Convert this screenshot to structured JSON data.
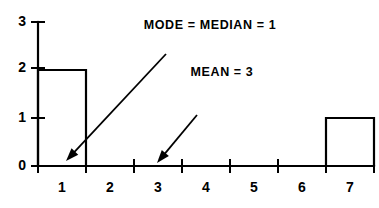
{
  "chart_data": {
    "type": "bar",
    "title": "",
    "subtitle": "",
    "xlabel": "",
    "ylabel": "",
    "categories": [
      "1",
      "2",
      "3",
      "4",
      "5",
      "6",
      "7"
    ],
    "values": [
      2,
      0,
      0,
      0,
      0,
      0,
      1
    ],
    "series": [
      {
        "name": "frequency",
        "values": [
          2,
          0,
          0,
          0,
          0,
          0,
          1
        ]
      }
    ],
    "xlim": [
      0.5,
      7.5
    ],
    "ylim": [
      0,
      3
    ],
    "x_tick_labels": [
      "1",
      "2",
      "3",
      "4",
      "5",
      "6",
      "7"
    ],
    "y_tick_labels": [
      "0",
      "1",
      "2",
      "3"
    ],
    "y_ticks": [
      0,
      1,
      2,
      3
    ],
    "x_bin_edges": [
      0.5,
      1.5,
      2.5,
      3.5,
      4.5,
      5.5,
      6.5,
      7.5
    ],
    "grid": false,
    "legend": false,
    "legend_position": "none",
    "bar_style": "outline",
    "bar_fill": "#ffffff",
    "bar_stroke": "#000000",
    "axis_color": "#000000",
    "background": "#ffffff",
    "annotations": [
      {
        "id": "mode-median",
        "text": "MODE = MEDIAN = 1",
        "text_x": 210,
        "text_y": 26,
        "arrow_from_x": 166,
        "arrow_from_y": 54,
        "arrow_to_x": 66,
        "arrow_to_y": 161,
        "points_to_value": 1
      },
      {
        "id": "mean",
        "text": "MEAN = 3",
        "text_x": 222,
        "text_y": 73,
        "arrow_from_x": 197,
        "arrow_from_y": 115,
        "arrow_to_x": 157,
        "arrow_to_y": 163,
        "points_to_value": 3
      }
    ]
  },
  "axes": {
    "y_label_0": "0",
    "y_label_1": "1",
    "y_label_2": "2",
    "y_label_3": "3",
    "x_label_1": "1",
    "x_label_2": "2",
    "x_label_3": "3",
    "x_label_4": "4",
    "x_label_5": "5",
    "x_label_6": "6",
    "x_label_7": "7"
  },
  "annotations": {
    "mode_median": "MODE = MEDIAN = 1",
    "mean": "MEAN = 3"
  }
}
